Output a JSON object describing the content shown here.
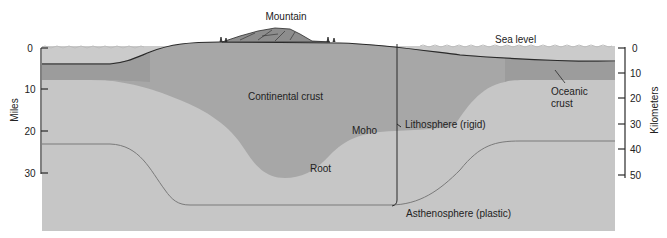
{
  "diagram": {
    "type": "cross-section",
    "labels": {
      "mountain": "Mountain",
      "sea_level": "Sea level",
      "continental_crust": "Continental crust",
      "oceanic_crust_line1": "Oceanic",
      "oceanic_crust_line2": "crust",
      "moho": "Moho",
      "root": "Root",
      "lithosphere": "Lithosphere (rigid)",
      "asthenosphere": "Asthenosphere (plastic)"
    },
    "left_axis": {
      "title": "Miles",
      "ticks": [
        "0",
        "10",
        "20",
        "30"
      ]
    },
    "right_axis": {
      "title": "Kilometers",
      "ticks": [
        "0",
        "10",
        "20",
        "30",
        "40",
        "50"
      ]
    },
    "colors": {
      "sea": "#c9c9c9",
      "mantle": "#c4c4c4",
      "oceanic_crust": "#9a9a9a",
      "continental_crust": "#a6a6a6",
      "outline": "#2a2a2a",
      "boundary": "#777777"
    }
  }
}
